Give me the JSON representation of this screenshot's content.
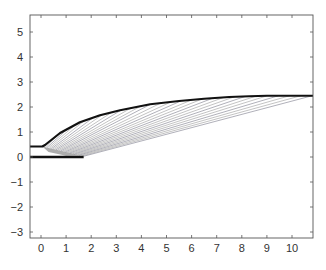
{
  "chart_data": {
    "type": "line",
    "title": "",
    "xlabel": "",
    "ylabel": "",
    "xlim": [
      -0.45,
      10.85
    ],
    "ylim": [
      -3.2,
      5.7
    ],
    "grid": false,
    "legend": null,
    "x_ticks": [
      0,
      1,
      2,
      3,
      4,
      5,
      6,
      7,
      8,
      9,
      10
    ],
    "y_ticks": [
      -3,
      -2,
      -1,
      0,
      1,
      2,
      3,
      4,
      5
    ],
    "series": [
      {
        "name": "lower-boundary",
        "style": "thick-black",
        "x": [
          -0.45,
          1.7
        ],
        "y": [
          0.0,
          0.0
        ]
      },
      {
        "name": "upper-boundary-curve",
        "style": "thick-black",
        "x": [
          -0.45,
          0.05,
          0.16,
          0.76,
          1.55,
          2.35,
          3.15,
          4.35,
          5.5,
          6.5,
          7.5,
          8.3,
          9.0,
          10.85
        ],
        "y": [
          0.42,
          0.42,
          0.48,
          0.96,
          1.39,
          1.67,
          1.87,
          2.11,
          2.24,
          2.33,
          2.4,
          2.43,
          2.45,
          2.45
        ]
      },
      {
        "name": "fan-lines",
        "style": "thin-gray",
        "description": "family of thin lines from lower segment (0..1.7, 0) up to points on the upper curve",
        "count": 28
      }
    ]
  },
  "caption": {
    "text_visible": false
  }
}
